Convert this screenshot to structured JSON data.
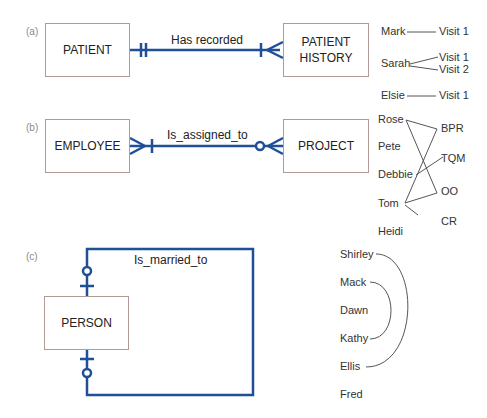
{
  "panels": {
    "a": {
      "label": "(a)",
      "left_entity": "PATIENT",
      "right_entity_line1": "PATIENT",
      "right_entity_line2": "HISTORY",
      "relationship": "Has recorded",
      "left_cardinality": "mandatory-one",
      "right_cardinality": "mandatory-many",
      "instances": {
        "left": [
          "Mark",
          "Sarah",
          "Elsie"
        ],
        "right": [
          "Visit 1",
          "Visit 1",
          "Visit 2",
          "Visit 1"
        ],
        "links": [
          [
            "Mark",
            "Visit 1"
          ],
          [
            "Sarah",
            "Visit 1"
          ],
          [
            "Sarah",
            "Visit 2"
          ],
          [
            "Elsie",
            "Visit 1"
          ]
        ]
      }
    },
    "b": {
      "label": "(b)",
      "left_entity": "EMPLOYEE",
      "right_entity": "PROJECT",
      "relationship": "Is_assigned_to",
      "left_cardinality": "mandatory-many",
      "right_cardinality": "optional-many",
      "instances": {
        "left": [
          "Rose",
          "Pete",
          "Debbie",
          "Tom",
          "Heidi"
        ],
        "right": [
          "BPR",
          "TQM",
          "OO",
          "CR"
        ],
        "links": [
          [
            "Rose",
            "BPR"
          ],
          [
            "Rose",
            "OO"
          ],
          [
            "Debbie",
            "TQM"
          ],
          [
            "Tom",
            "BPR"
          ],
          [
            "Tom",
            "OO"
          ],
          [
            "Tom",
            "CR"
          ]
        ]
      }
    },
    "c": {
      "label": "(c)",
      "entity": "PERSON",
      "relationship": "Is_married_to",
      "cardinality": "optional-one",
      "instances": {
        "people": [
          "Shirley",
          "Mack",
          "Dawn",
          "Kathy",
          "Ellis",
          "Fred"
        ],
        "links": [
          [
            "Shirley",
            "Ellis"
          ],
          [
            "Mack",
            "Kathy"
          ]
        ]
      }
    }
  },
  "colors": {
    "line": "#1f4f96",
    "entity_border": "#b49a96",
    "instance_line": "#555555"
  }
}
